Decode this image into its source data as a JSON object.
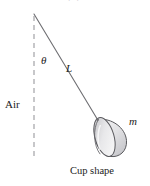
{
  "figure": {
    "canvas": {
      "width": 150,
      "height": 186,
      "background": "#ffffff"
    },
    "caption": "Cup shape",
    "top_cut_text": "p p",
    "labels": {
      "angle": "θ",
      "length": "L",
      "mass": "m",
      "medium": "Air"
    },
    "colors": {
      "line": "#6e6e72",
      "dashed_line": "#9a9a9e",
      "text": "#222222",
      "cup_outline": "#5a5a5e",
      "cup_fill_light": "#fbfbfb",
      "cup_fill_dark": "#b9b9bd",
      "rim_fill_light": "#f2f2f3",
      "rim_fill_dark": "#c6c6ca"
    },
    "geometry": {
      "pivot": {
        "x": 34,
        "y": 14
      },
      "dashed_line_end": {
        "x": 34,
        "y": 160
      },
      "string_end": {
        "x": 97,
        "y": 119
      },
      "cup_center": {
        "x": 110,
        "y": 136
      }
    }
  }
}
